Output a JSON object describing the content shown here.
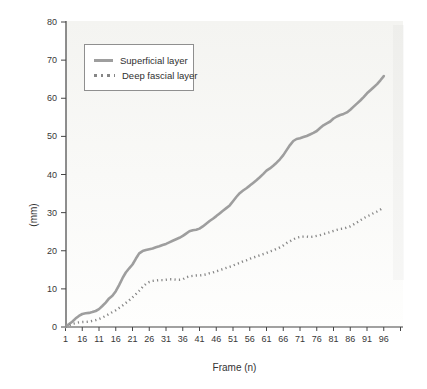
{
  "figure": {
    "background": "#ffffff",
    "plot_tint_top": "#f4f4f1",
    "plot_tint_bottom": "#fefefd",
    "axis_color": "#454545",
    "tick_text_color": "#383838"
  },
  "legend": {
    "position": "upper-left",
    "items": [
      {
        "label": "Superficial layer",
        "line_style": "solid",
        "color": "#9e9e9e"
      },
      {
        "label": "Deep fascial layer",
        "line_style": "dotted",
        "color": "#868686"
      }
    ]
  },
  "chart_data": {
    "type": "line",
    "title": "",
    "xlabel": "Frame (n)",
    "ylabel": "(mm)",
    "xlim": [
      1,
      101
    ],
    "ylim": [
      0,
      80
    ],
    "grid": false,
    "legend_position": "upper-left",
    "x_ticks": [
      {
        "value": 1,
        "label": "1"
      },
      {
        "value": 6,
        "label": "16"
      },
      {
        "value": 11,
        "label": "11"
      },
      {
        "value": 16,
        "label": "16"
      },
      {
        "value": 21,
        "label": "21"
      },
      {
        "value": 26,
        "label": "26"
      },
      {
        "value": 31,
        "label": "31"
      },
      {
        "value": 36,
        "label": "36"
      },
      {
        "value": 41,
        "label": "41"
      },
      {
        "value": 46,
        "label": "46"
      },
      {
        "value": 51,
        "label": "51"
      },
      {
        "value": 56,
        "label": "56"
      },
      {
        "value": 61,
        "label": "61"
      },
      {
        "value": 66,
        "label": "66"
      },
      {
        "value": 71,
        "label": "71"
      },
      {
        "value": 76,
        "label": "76"
      },
      {
        "value": 81,
        "label": "81"
      },
      {
        "value": 86,
        "label": "86"
      },
      {
        "value": 91,
        "label": "91"
      },
      {
        "value": 96,
        "label": "96"
      },
      {
        "value": 101,
        "label": ""
      }
    ],
    "y_ticks": [
      0,
      10,
      20,
      30,
      40,
      50,
      60,
      70,
      80
    ],
    "series": [
      {
        "name": "Superficial layer",
        "style": "solid",
        "color": "#9e9e9e",
        "width": 2.6,
        "points": [
          [
            1,
            0
          ],
          [
            2,
            0.7
          ],
          [
            3,
            1.4
          ],
          [
            4,
            2.2
          ],
          [
            5,
            2.9
          ],
          [
            6,
            3.4
          ],
          [
            7,
            3.6
          ],
          [
            8,
            3.7
          ],
          [
            9,
            3.9
          ],
          [
            10,
            4.2
          ],
          [
            11,
            4.7
          ],
          [
            12,
            5.5
          ],
          [
            13,
            6.4
          ],
          [
            14,
            7.5
          ],
          [
            15,
            8.2
          ],
          [
            16,
            9.4
          ],
          [
            17,
            11.0
          ],
          [
            18,
            12.8
          ],
          [
            19,
            14.3
          ],
          [
            20,
            15.4
          ],
          [
            21,
            16.4
          ],
          [
            22,
            17.9
          ],
          [
            23,
            19.3
          ],
          [
            24,
            19.9
          ],
          [
            25,
            20.2
          ],
          [
            26,
            20.4
          ],
          [
            27,
            20.6
          ],
          [
            28,
            20.9
          ],
          [
            29,
            21.2
          ],
          [
            30,
            21.5
          ],
          [
            31,
            21.8
          ],
          [
            32,
            22.2
          ],
          [
            33,
            22.6
          ],
          [
            34,
            23.0
          ],
          [
            35,
            23.4
          ],
          [
            36,
            23.9
          ],
          [
            37,
            24.5
          ],
          [
            38,
            25.1
          ],
          [
            39,
            25.4
          ],
          [
            40,
            25.5
          ],
          [
            41,
            25.8
          ],
          [
            42,
            26.4
          ],
          [
            43,
            27.1
          ],
          [
            44,
            27.8
          ],
          [
            45,
            28.4
          ],
          [
            46,
            29.1
          ],
          [
            47,
            29.8
          ],
          [
            48,
            30.5
          ],
          [
            49,
            31.2
          ],
          [
            50,
            31.9
          ],
          [
            51,
            33.0
          ],
          [
            52,
            34.1
          ],
          [
            53,
            35.1
          ],
          [
            54,
            35.8
          ],
          [
            55,
            36.4
          ],
          [
            56,
            37.1
          ],
          [
            57,
            37.8
          ],
          [
            58,
            38.5
          ],
          [
            59,
            39.3
          ],
          [
            60,
            40.1
          ],
          [
            61,
            41.0
          ],
          [
            62,
            41.6
          ],
          [
            63,
            42.3
          ],
          [
            64,
            43.1
          ],
          [
            65,
            44.0
          ],
          [
            66,
            45.1
          ],
          [
            67,
            46.4
          ],
          [
            68,
            47.7
          ],
          [
            69,
            48.8
          ],
          [
            70,
            49.3
          ],
          [
            71,
            49.5
          ],
          [
            72,
            49.8
          ],
          [
            73,
            50.1
          ],
          [
            74,
            50.5
          ],
          [
            75,
            50.9
          ],
          [
            76,
            51.4
          ],
          [
            77,
            52.2
          ],
          [
            78,
            52.9
          ],
          [
            79,
            53.4
          ],
          [
            80,
            53.9
          ],
          [
            81,
            54.7
          ],
          [
            82,
            55.2
          ],
          [
            83,
            55.6
          ],
          [
            84,
            55.9
          ],
          [
            85,
            56.3
          ],
          [
            86,
            57.0
          ],
          [
            87,
            57.8
          ],
          [
            88,
            58.6
          ],
          [
            89,
            59.4
          ],
          [
            90,
            60.3
          ],
          [
            91,
            61.3
          ],
          [
            92,
            62.1
          ],
          [
            93,
            62.9
          ],
          [
            94,
            63.7
          ],
          [
            95,
            64.7
          ],
          [
            96,
            65.8
          ]
        ]
      },
      {
        "name": "Deep fascial layer",
        "style": "dotted",
        "color": "#868686",
        "width": 2.4,
        "points": [
          [
            1,
            0
          ],
          [
            2,
            0.4
          ],
          [
            3,
            0.8
          ],
          [
            4,
            1.0
          ],
          [
            5,
            1.2
          ],
          [
            6,
            1.3
          ],
          [
            7,
            1.3
          ],
          [
            8,
            1.4
          ],
          [
            9,
            1.6
          ],
          [
            10,
            1.8
          ],
          [
            11,
            2.1
          ],
          [
            12,
            2.5
          ],
          [
            13,
            2.9
          ],
          [
            14,
            3.4
          ],
          [
            15,
            3.9
          ],
          [
            16,
            4.4
          ],
          [
            17,
            5.0
          ],
          [
            18,
            5.6
          ],
          [
            19,
            6.3
          ],
          [
            20,
            7.0
          ],
          [
            21,
            7.8
          ],
          [
            22,
            8.6
          ],
          [
            23,
            9.5
          ],
          [
            24,
            10.5
          ],
          [
            25,
            11.3
          ],
          [
            26,
            11.8
          ],
          [
            27,
            12.1
          ],
          [
            28,
            12.2
          ],
          [
            29,
            12.3
          ],
          [
            30,
            12.3
          ],
          [
            31,
            12.4
          ],
          [
            32,
            12.5
          ],
          [
            33,
            12.5
          ],
          [
            34,
            12.4
          ],
          [
            35,
            12.4
          ],
          [
            36,
            12.5
          ],
          [
            37,
            13.0
          ],
          [
            38,
            13.3
          ],
          [
            39,
            13.4
          ],
          [
            40,
            13.5
          ],
          [
            41,
            13.5
          ],
          [
            42,
            13.6
          ],
          [
            43,
            13.8
          ],
          [
            44,
            14.1
          ],
          [
            45,
            14.3
          ],
          [
            46,
            14.6
          ],
          [
            47,
            14.9
          ],
          [
            48,
            15.2
          ],
          [
            49,
            15.5
          ],
          [
            50,
            15.8
          ],
          [
            51,
            16.1
          ],
          [
            52,
            16.5
          ],
          [
            53,
            16.8
          ],
          [
            54,
            17.2
          ],
          [
            55,
            17.5
          ],
          [
            56,
            17.9
          ],
          [
            57,
            18.2
          ],
          [
            58,
            18.5
          ],
          [
            59,
            18.8
          ],
          [
            60,
            19.1
          ],
          [
            61,
            19.4
          ],
          [
            62,
            19.8
          ],
          [
            63,
            20.1
          ],
          [
            64,
            20.5
          ],
          [
            65,
            20.9
          ],
          [
            66,
            21.4
          ],
          [
            67,
            22.0
          ],
          [
            68,
            22.5
          ],
          [
            69,
            23.0
          ],
          [
            70,
            23.4
          ],
          [
            71,
            23.6
          ],
          [
            72,
            23.7
          ],
          [
            73,
            23.7
          ],
          [
            74,
            23.6
          ],
          [
            75,
            23.7
          ],
          [
            76,
            23.9
          ],
          [
            77,
            24.1
          ],
          [
            78,
            24.4
          ],
          [
            79,
            24.6
          ],
          [
            80,
            24.9
          ],
          [
            81,
            25.2
          ],
          [
            82,
            25.5
          ],
          [
            83,
            25.7
          ],
          [
            84,
            25.8
          ],
          [
            85,
            26.1
          ],
          [
            86,
            26.4
          ],
          [
            87,
            26.9
          ],
          [
            88,
            27.4
          ],
          [
            89,
            28.0
          ],
          [
            90,
            28.5
          ],
          [
            91,
            29.0
          ],
          [
            92,
            29.4
          ],
          [
            93,
            29.9
          ],
          [
            94,
            30.3
          ],
          [
            95,
            30.8
          ],
          [
            96,
            31.4
          ]
        ]
      }
    ]
  }
}
